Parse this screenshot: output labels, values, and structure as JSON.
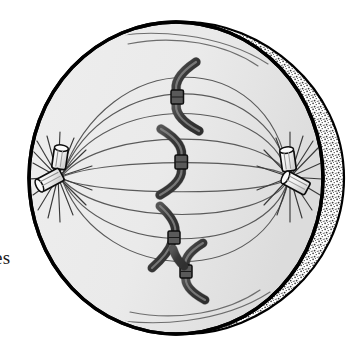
{
  "figure": {
    "style": "black-and-white textbook line drawing with stippled shading",
    "caption_fragment": "es",
    "colors": {
      "outline": "#000000",
      "cytoplasm_fill": "#ebebeb",
      "cytoplasm_fill_shaded": "#e0e0e0",
      "stipple_band": "#9a9a9a",
      "spindle_fiber": "#4f4f4f",
      "chromosome_fill": "#4a4a4a",
      "chromosome_outline": "#000000",
      "centriole_fill": "#f2f2f2",
      "aster_ray": "#3a3a3a",
      "background": "#ffffff"
    },
    "cell": {
      "label": "cell membrane",
      "center_x": 187,
      "center_y": 178,
      "radius_x": 157,
      "radius_y": 156,
      "rim_band_label": "stippled depth band",
      "rim_band_side": "right"
    },
    "poles": [
      {
        "name": "left-centrosome",
        "label": "centrosome (pair of centrioles)",
        "x": 58,
        "y": 177,
        "aster_ray_count": 16,
        "centriole_count": 2
      },
      {
        "name": "right-centrosome",
        "label": "centrosome (pair of centrioles)",
        "x": 290,
        "y": 177,
        "aster_ray_count": 16,
        "centriole_count": 2
      }
    ],
    "spindle": {
      "label": "mitotic spindle (microtubule fibers)",
      "fiber_count": 9,
      "description": "thin curved fibers arcing from pole to pole"
    },
    "chromosomes": [
      {
        "name": "chromosome-1",
        "x": 186,
        "y": 93,
        "orientation": "opens-right"
      },
      {
        "name": "chromosome-2",
        "x": 176,
        "y": 158,
        "orientation": "opens-left"
      },
      {
        "name": "chromosome-3",
        "x": 175,
        "y": 233,
        "orientation": "opens-right"
      },
      {
        "name": "chromosome-4",
        "x": 190,
        "y": 265,
        "orientation": "opens-right"
      },
      {
        "name": "chromosome-5",
        "x": 178,
        "y": 255,
        "orientation": "opens-left"
      }
    ],
    "equator": {
      "label": "metaphase plate (cell equator)",
      "x": 187
    }
  }
}
